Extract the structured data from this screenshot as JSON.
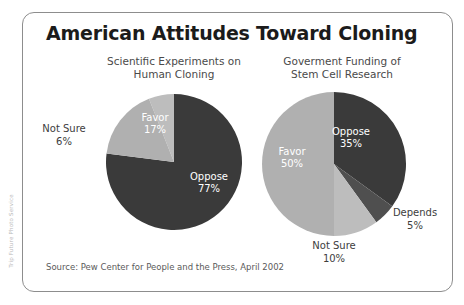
{
  "figure": {
    "title": "American Attitudes Toward Cloning",
    "source": "Source: Pew Center for People and the Press, April 2002",
    "credit": "Trip Future Photo Service"
  },
  "charts": {
    "left": {
      "subtitle_line1": "Scientific Experiments on",
      "subtitle_line2": "Human Cloning",
      "labels": {
        "favor_name": "Favor",
        "favor_value": "17%",
        "oppose_name": "Oppose",
        "oppose_value": "77%",
        "notsure_name": "Not Sure",
        "notsure_value": "6%"
      }
    },
    "right": {
      "subtitle_line1": "Goverment Funding of",
      "subtitle_line2": "Stem Cell Research",
      "labels": {
        "oppose_name": "Oppose",
        "oppose_value": "35%",
        "favor_name": "Favor",
        "favor_value": "50%",
        "depends_name": "Depends",
        "depends_value": "5%",
        "notsure_name": "Not Sure",
        "notsure_value": "10%"
      }
    }
  },
  "colors": {
    "dark": "#3a3a3a",
    "mid_dark": "#4f4f4f",
    "light": "#b0b0b0",
    "mid_light": "#bdbdbd",
    "frame": "#8d8d8d",
    "title": "#1b1b1b",
    "label_outer": "#3d3d3d",
    "label_inner": "#ffffff"
  },
  "chart_data": [
    {
      "type": "pie",
      "title": "Scientific Experiments on Human Cloning",
      "id": "scientific-experiments-human-cloning",
      "categories": [
        "Oppose",
        "Favor",
        "Not Sure"
      ],
      "values": [
        77,
        17,
        6
      ],
      "unit": "percent",
      "labels": [
        "77%",
        "17%",
        "6%"
      ],
      "colors": [
        "#3a3a3a",
        "#b0b0b0",
        "#bdbdbd"
      ],
      "start_angle_deg": 0,
      "direction": "clockwise",
      "legend": "none",
      "annotations": [
        "Favor 17%",
        "Oppose 77%",
        "Not Sure 6%"
      ]
    },
    {
      "type": "pie",
      "title": "Goverment Funding of Stem Cell Research",
      "id": "government-funding-stem-cell-research",
      "categories": [
        "Oppose",
        "Depends",
        "Not Sure",
        "Favor"
      ],
      "values": [
        35,
        5,
        10,
        50
      ],
      "unit": "percent",
      "labels": [
        "35%",
        "5%",
        "10%",
        "50%"
      ],
      "colors": [
        "#3a3a3a",
        "#4f4f4f",
        "#bdbdbd",
        "#b0b0b0"
      ],
      "start_angle_deg": 0,
      "direction": "clockwise",
      "legend": "none",
      "annotations": [
        "Oppose 35%",
        "Depends 5%",
        "Not Sure 10%",
        "Favor 50%"
      ]
    }
  ]
}
